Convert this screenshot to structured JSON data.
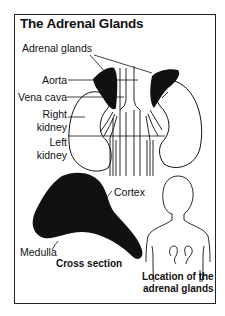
{
  "figure": {
    "title": "The Adrenal Glands",
    "labels": {
      "adrenal_glands": "Adrenal glands",
      "aorta": "Aorta",
      "vena_cava": "Vena cava",
      "right_kidney_line1": "Right",
      "right_kidney_line2": "kidney",
      "left_kidney_line1": "Left",
      "left_kidney_line2": "kidney",
      "cortex": "Cortex",
      "medulla": "Medulla",
      "cross_section": "Cross section",
      "location_line1": "Location of the",
      "location_line2": "adrenal glands"
    },
    "colors": {
      "ink": "#111111",
      "background": "#ffffff",
      "frame": "#222222"
    }
  }
}
